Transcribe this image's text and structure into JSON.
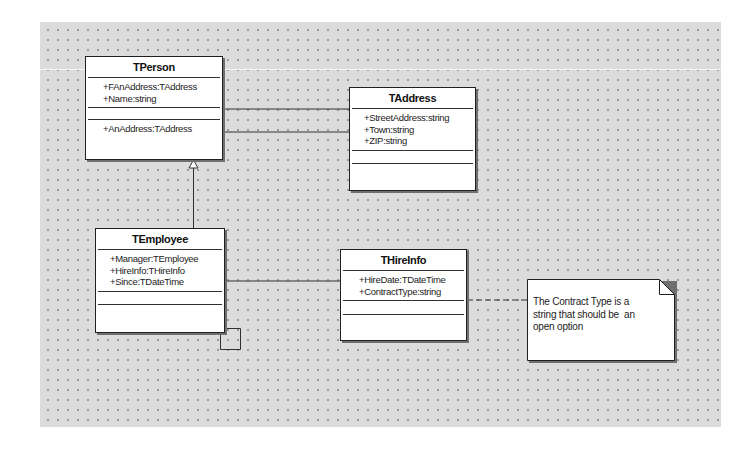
{
  "diagram": {
    "type": "UML class diagram",
    "classes": [
      {
        "id": "tperson",
        "name": "TPerson",
        "attributes": [
          "+FAnAddress:TAddress",
          "+Name:string"
        ],
        "operations": [],
        "properties": [
          "+AnAddress:TAddress"
        ]
      },
      {
        "id": "taddress",
        "name": "TAddress",
        "attributes": [
          "+StreetAddress:string",
          "+Town:string",
          "+ZIP:string"
        ],
        "operations": [],
        "properties": []
      },
      {
        "id": "temployee",
        "name": "TEmployee",
        "attributes": [
          "+Manager:TEmployee",
          "+HireInfo:THireInfo",
          "+Since:TDateTime"
        ],
        "operations": [],
        "properties": []
      },
      {
        "id": "thireinfo",
        "name": "THireInfo",
        "attributes": [
          "+HireDate:TDateTime",
          "+ContractType:string"
        ],
        "operations": [],
        "properties": []
      }
    ],
    "relationships": [
      {
        "type": "association",
        "from": "TPerson",
        "to": "TAddress"
      },
      {
        "type": "association",
        "from": "TPerson",
        "to": "TAddress"
      },
      {
        "type": "generalization",
        "from": "TEmployee",
        "to": "TPerson"
      },
      {
        "type": "association",
        "from": "TEmployee",
        "to": "THireInfo"
      },
      {
        "type": "self-association",
        "from": "TEmployee",
        "to": "TEmployee"
      },
      {
        "type": "note-link",
        "from": "THireInfo",
        "to": "note"
      }
    ],
    "note": {
      "lines": [
        "The Contract Type is a",
        "string that should be  an",
        "open option"
      ]
    }
  },
  "colors": {
    "canvas": "#dcdcdc",
    "grid_dot": "#9a9a9a",
    "box_fill": "#ffffff",
    "line": "#303030",
    "shadow": "#6f6f6f"
  }
}
